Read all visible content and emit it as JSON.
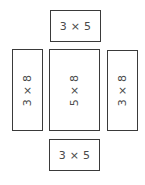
{
  "diagram": {
    "line_color": "#3a3a3a",
    "text_color": "#4a4a4a",
    "faces": [
      {
        "id": "top",
        "label": "3 × 5",
        "orientation": "horizontal"
      },
      {
        "id": "left",
        "label": "3 × 8",
        "orientation": "vertical"
      },
      {
        "id": "center",
        "label": "5 × 8",
        "orientation": "vertical"
      },
      {
        "id": "right",
        "label": "3 × 8",
        "orientation": "vertical"
      },
      {
        "id": "bottom",
        "label": "3 × 5",
        "orientation": "horizontal"
      }
    ]
  }
}
